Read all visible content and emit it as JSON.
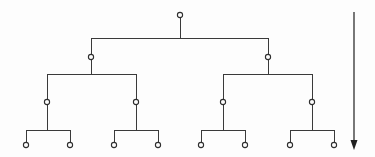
{
  "diagram": {
    "type": "tree-diagram",
    "canvas": {
      "width": 375,
      "height": 157
    },
    "colors": {
      "background": "#fdfdfd",
      "edge": "#3a3a3a",
      "node_stroke": "#2e2e2e",
      "node_fill": "#fdfdfd",
      "arrow": "#1f1f1f"
    },
    "structure": {
      "depth": 4,
      "node_count": 15,
      "leaf_count": 8,
      "branching_factor": 2,
      "node_radius": 2.6
    },
    "levels": [
      {
        "index": 0,
        "name": "root",
        "y": 15,
        "node_count": 1,
        "x_positions": [
          180
        ]
      },
      {
        "index": 1,
        "name": "level-2",
        "y": 57,
        "node_count": 2,
        "x_positions": [
          91,
          268
        ]
      },
      {
        "index": 2,
        "name": "level-3",
        "y": 102,
        "node_count": 4,
        "x_positions": [
          47,
          136,
          223,
          312
        ]
      },
      {
        "index": 3,
        "name": "leaves",
        "y": 145,
        "node_count": 8,
        "x_positions": [
          26,
          70,
          114,
          158,
          201,
          245,
          290,
          334
        ]
      }
    ],
    "connector_bars": [
      {
        "y": 38,
        "x1": 91,
        "x2": 268,
        "parent_x": 180
      },
      {
        "y": 74,
        "x1": 47,
        "x2": 136,
        "parent_x": 91
      },
      {
        "y": 74,
        "x1": 223,
        "x2": 312,
        "parent_x": 268
      },
      {
        "y": 130,
        "x1": 26,
        "x2": 70,
        "parent_x": 47
      },
      {
        "y": 130,
        "x1": 114,
        "x2": 158,
        "parent_x": 136
      },
      {
        "y": 130,
        "x1": 201,
        "x2": 245,
        "parent_x": 223
      },
      {
        "y": 130,
        "x1": 290,
        "x2": 334,
        "parent_x": 312
      }
    ],
    "depth_arrow": {
      "label": "",
      "direction": "down",
      "x": 354,
      "y_start": 12,
      "y_end": 150,
      "head_width": 7,
      "head_length": 10
    }
  }
}
